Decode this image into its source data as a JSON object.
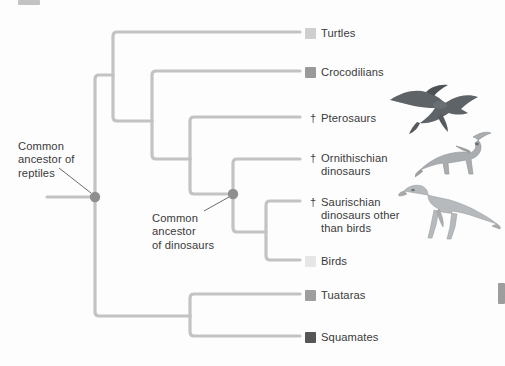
{
  "figure": {
    "type": "cladogram",
    "root_label": "reptile-root"
  },
  "colors": {
    "branch": "#c3c3c3",
    "node": "#8f8f8f",
    "leader": "#5a5a5a",
    "text": "#3a3a3a",
    "turtles": "#cfcfcf",
    "crocodilians": "#9a9a9a",
    "birds": "#e6e6e6",
    "tuataras": "#9e9e9e",
    "squamates": "#565656"
  },
  "taxa": [
    {
      "id": "turtles",
      "label": "Turtles",
      "dagger": false,
      "swatch": true,
      "swatch_color": "#cfcfcf",
      "x": 305,
      "y": 27
    },
    {
      "id": "crocodilians",
      "label": "Crocodilians",
      "dagger": false,
      "swatch": true,
      "swatch_color": "#9a9a9a",
      "x": 305,
      "y": 66
    },
    {
      "id": "pterosaurs",
      "label": "Pterosaurs",
      "dagger": true,
      "swatch": false,
      "swatch_color": "",
      "x": 305,
      "y": 112
    },
    {
      "id": "ornithischian-dinosaurs",
      "label": "Ornithischian\ndinosaurs",
      "dagger": true,
      "swatch": false,
      "swatch_color": "",
      "x": 305,
      "y": 152
    },
    {
      "id": "saurischian-dinosaurs",
      "label": "Saurischian\ndinosaurs other\nthan birds",
      "dagger": true,
      "swatch": false,
      "swatch_color": "",
      "x": 305,
      "y": 196
    },
    {
      "id": "birds",
      "label": "Birds",
      "dagger": false,
      "swatch": true,
      "swatch_color": "#e6e6e6",
      "x": 305,
      "y": 255
    },
    {
      "id": "tuataras",
      "label": "Tuataras",
      "dagger": false,
      "swatch": true,
      "swatch_color": "#9e9e9e",
      "x": 305,
      "y": 289
    },
    {
      "id": "squamates",
      "label": "Squamates",
      "dagger": false,
      "swatch": true,
      "swatch_color": "#565656",
      "x": 305,
      "y": 331
    }
  ],
  "annotations": [
    {
      "id": "common-ancestor-reptiles",
      "text": "Common\nancestor of\nreptiles",
      "x": 18,
      "y": 140
    },
    {
      "id": "common-ancestor-dinosaurs",
      "text": "Common\nancestor\nof dinosaurs",
      "x": 152,
      "y": 212
    }
  ],
  "nodes": [
    {
      "id": "reptile-root-node",
      "x": 95,
      "y": 197
    },
    {
      "id": "dinosaur-ancestor-node",
      "x": 233,
      "y": 194
    }
  ],
  "illustrations": [
    {
      "id": "pterosaur-illustration",
      "alt": "Pterosaur in flight"
    },
    {
      "id": "hadrosaur-illustration",
      "alt": "Ornithischian dinosaur (Parasaurolophus)"
    },
    {
      "id": "theropod-illustration",
      "alt": "Saurischian theropod dinosaur"
    }
  ],
  "dagger_symbol": "†"
}
